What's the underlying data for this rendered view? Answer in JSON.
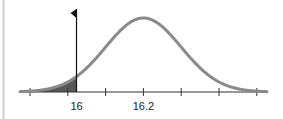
{
  "chart_data": {
    "type": "area",
    "title": "",
    "xlabel": "",
    "ylabel": "",
    "distribution": "normal",
    "mean": 16.2,
    "std_dev": 0.113,
    "tick_count": 7,
    "tick_labels": [
      {
        "index": 1,
        "value": 16,
        "label": "16"
      },
      {
        "index": 3,
        "value": 16.2,
        "label": "16.2"
      }
    ],
    "cutoff": {
      "value": 16,
      "label": "16",
      "marker": "flag-pointing-left"
    },
    "shaded_region": {
      "from": "-inf",
      "to": 16,
      "description": "left tail shaded below cutoff"
    },
    "grid": false,
    "legend": null,
    "colors": {
      "curve": "#8a8a8a",
      "shade": "#3a3a3a",
      "axis": "#333333",
      "cutoff_line": "#111111",
      "border": "#d0d0d0"
    }
  }
}
